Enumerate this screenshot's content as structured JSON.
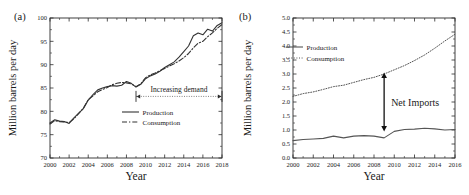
{
  "figure": {
    "panels": [
      {
        "tag": "(a)",
        "xlabel": "Year",
        "ylabel": "Million barrels per day",
        "annotation": "Increasing demand"
      },
      {
        "tag": "(b)",
        "xlabel": "Year",
        "ylabel": "Million barrels per day",
        "annotation": "Net Imports"
      }
    ]
  },
  "chart_data": [
    {
      "type": "line",
      "panel": "(a)",
      "title": "",
      "xlabel": "Year",
      "ylabel": "Million barrels per day",
      "xlim": [
        2000,
        2018
      ],
      "ylim": [
        70,
        100
      ],
      "xticks": [
        2000,
        2002,
        2004,
        2006,
        2008,
        2010,
        2012,
        2014,
        2016,
        2018
      ],
      "yticks": [
        70,
        75,
        80,
        85,
        90,
        95,
        100
      ],
      "grid": false,
      "legend_position": "center-right",
      "annotations": [
        {
          "text": "Increasing demand",
          "x_start": 2009.0,
          "x_end": 2018.0,
          "y": 83.2,
          "style": "double-arrow"
        }
      ],
      "x": [
        2000.0,
        2000.5,
        2001.0,
        2001.5,
        2002.0,
        2002.5,
        2003.0,
        2003.5,
        2004.0,
        2004.5,
        2005.0,
        2005.5,
        2006.0,
        2006.5,
        2007.0,
        2007.5,
        2008.0,
        2008.5,
        2009.0,
        2009.5,
        2010.0,
        2010.5,
        2011.0,
        2011.5,
        2012.0,
        2012.5,
        2013.0,
        2013.5,
        2014.0,
        2014.5,
        2015.0,
        2015.5,
        2016.0,
        2016.5,
        2017.0,
        2017.5,
        2018.0
      ],
      "series": [
        {
          "name": "Production",
          "style": "solid",
          "color": "#333333",
          "values": [
            77.5,
            78.2,
            77.9,
            77.8,
            77.4,
            78.6,
            79.6,
            80.6,
            82.4,
            83.6,
            84.6,
            85.0,
            85.3,
            85.5,
            85.4,
            85.6,
            86.4,
            86.0,
            85.2,
            85.8,
            87.0,
            87.6,
            88.0,
            88.6,
            89.4,
            90.0,
            90.6,
            91.6,
            92.8,
            94.0,
            96.2,
            96.8,
            96.4,
            97.6,
            97.2,
            98.4,
            99.0
          ]
        },
        {
          "name": "Consumption",
          "style": "dash-dot",
          "color": "#333333",
          "values": [
            77.3,
            78.0,
            77.8,
            77.7,
            77.6,
            78.4,
            79.5,
            80.7,
            82.5,
            83.3,
            84.2,
            84.7,
            85.1,
            85.7,
            86.0,
            86.2,
            86.1,
            85.9,
            85.3,
            85.9,
            87.2,
            87.8,
            88.2,
            88.7,
            89.2,
            89.7,
            90.2,
            90.8,
            91.5,
            92.4,
            93.6,
            94.6,
            95.0,
            96.0,
            96.8,
            97.8,
            98.6
          ]
        }
      ]
    },
    {
      "type": "line",
      "panel": "(b)",
      "title": "",
      "xlabel": "Year",
      "ylabel": "Million barrels per day",
      "xlim": [
        2000,
        2016
      ],
      "ylim": [
        0.0,
        5.0
      ],
      "xticks": [
        2000,
        2002,
        2004,
        2006,
        2008,
        2010,
        2012,
        2014,
        2016
      ],
      "yticks": [
        0.0,
        0.5,
        1.0,
        1.5,
        2.0,
        2.5,
        3.0,
        3.5,
        4.0,
        4.5,
        5.0
      ],
      "grid": false,
      "legend_position": "upper-left",
      "annotations": [
        {
          "text": "Net Imports",
          "x": 2009.0,
          "y_start": 0.95,
          "y_end": 3.05,
          "style": "double-arrow-vertical"
        }
      ],
      "x": [
        2000,
        2001,
        2002,
        2003,
        2004,
        2005,
        2006,
        2007,
        2008,
        2009,
        2010,
        2011,
        2012,
        2013,
        2014,
        2015,
        2016
      ],
      "series": [
        {
          "name": "Production",
          "style": "solid",
          "color": "#555555",
          "values": [
            0.62,
            0.66,
            0.68,
            0.7,
            0.78,
            0.72,
            0.78,
            0.8,
            0.78,
            0.72,
            0.95,
            1.02,
            1.03,
            1.06,
            1.04,
            1.0,
            1.02
          ]
        },
        {
          "name": "Consumption",
          "style": "dotted",
          "color": "#555555",
          "values": [
            2.2,
            2.3,
            2.36,
            2.45,
            2.55,
            2.6,
            2.7,
            2.8,
            2.88,
            3.0,
            3.15,
            3.3,
            3.48,
            3.68,
            3.92,
            4.18,
            4.42
          ]
        }
      ]
    }
  ]
}
